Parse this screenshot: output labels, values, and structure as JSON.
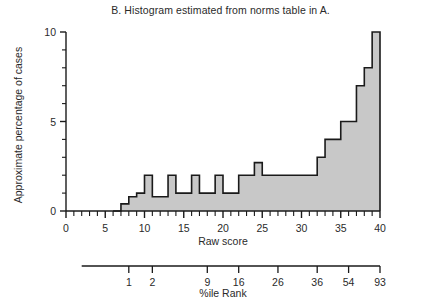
{
  "figure": {
    "title": "B. Histogram estimated from norms table in A."
  },
  "axes": {
    "y_title": "Approximate percentage of cases",
    "x_title": "Raw score",
    "secondary_title": "%ile Rank"
  },
  "chart_data": {
    "type": "bar",
    "title": "B. Histogram estimated from norms table in A.",
    "xlabel": "Raw score",
    "ylabel": "Approximate percentage of cases",
    "xlim": [
      0,
      40
    ],
    "ylim": [
      0,
      10
    ],
    "grid": false,
    "legend": null,
    "x_major_ticks": [
      0,
      5,
      10,
      15,
      20,
      25,
      30,
      35,
      40
    ],
    "x_major_tick_labels": [
      "0",
      "5",
      "10",
      "15",
      "20",
      "25",
      "30",
      "35",
      "40"
    ],
    "x_minor_tick_step": 1,
    "y_major_ticks": [
      0,
      5,
      10
    ],
    "y_major_tick_labels": [
      "0",
      "5",
      "10"
    ],
    "y_minor_tick_step": 1,
    "bin_width": 1,
    "bins": [
      {
        "x0": 6,
        "x1": 7,
        "value": 0
      },
      {
        "x0": 7,
        "x1": 8,
        "value": 0.4
      },
      {
        "x0": 8,
        "x1": 9,
        "value": 0.8
      },
      {
        "x0": 9,
        "x1": 10,
        "value": 1
      },
      {
        "x0": 10,
        "x1": 11,
        "value": 2
      },
      {
        "x0": 11,
        "x1": 12,
        "value": 0.8
      },
      {
        "x0": 12,
        "x1": 13,
        "value": 0.8
      },
      {
        "x0": 13,
        "x1": 14,
        "value": 2
      },
      {
        "x0": 14,
        "x1": 15,
        "value": 1
      },
      {
        "x0": 15,
        "x1": 16,
        "value": 1
      },
      {
        "x0": 16,
        "x1": 17,
        "value": 2
      },
      {
        "x0": 17,
        "x1": 18,
        "value": 1
      },
      {
        "x0": 18,
        "x1": 19,
        "value": 1
      },
      {
        "x0": 19,
        "x1": 20,
        "value": 2
      },
      {
        "x0": 20,
        "x1": 21,
        "value": 1
      },
      {
        "x0": 21,
        "x1": 22,
        "value": 1
      },
      {
        "x0": 22,
        "x1": 23,
        "value": 2
      },
      {
        "x0": 23,
        "x1": 24,
        "value": 2
      },
      {
        "x0": 24,
        "x1": 25,
        "value": 2.7
      },
      {
        "x0": 25,
        "x1": 26,
        "value": 2
      },
      {
        "x0": 26,
        "x1": 27,
        "value": 2
      },
      {
        "x0": 27,
        "x1": 28,
        "value": 2
      },
      {
        "x0": 28,
        "x1": 29,
        "value": 2
      },
      {
        "x0": 29,
        "x1": 30,
        "value": 2
      },
      {
        "x0": 30,
        "x1": 31,
        "value": 2
      },
      {
        "x0": 31,
        "x1": 32,
        "value": 2
      },
      {
        "x0": 32,
        "x1": 33,
        "value": 3
      },
      {
        "x0": 33,
        "x1": 34,
        "value": 4
      },
      {
        "x0": 34,
        "x1": 35,
        "value": 4
      },
      {
        "x0": 35,
        "x1": 36,
        "value": 5
      },
      {
        "x0": 36,
        "x1": 37,
        "value": 5
      },
      {
        "x0": 37,
        "x1": 38,
        "value": 7
      },
      {
        "x0": 38,
        "x1": 39,
        "value": 8
      },
      {
        "x0": 39,
        "x1": 40,
        "value": 10
      },
      {
        "x0": 40,
        "x1": 41,
        "value": 9
      }
    ],
    "fill_color": "#c8c8c8",
    "line_color": "#1a1a1a",
    "secondary_axis": {
      "label": "%ile Rank",
      "ticks": [
        {
          "raw_score": 8,
          "label": "1"
        },
        {
          "raw_score": 11,
          "label": "2"
        },
        {
          "raw_score": 18,
          "label": "9"
        },
        {
          "raw_score": 22,
          "label": "16"
        },
        {
          "raw_score": 27,
          "label": "26"
        },
        {
          "raw_score": 32,
          "label": "36"
        },
        {
          "raw_score": 36,
          "label": "54"
        },
        {
          "raw_score": 40,
          "label": "93"
        }
      ]
    }
  }
}
